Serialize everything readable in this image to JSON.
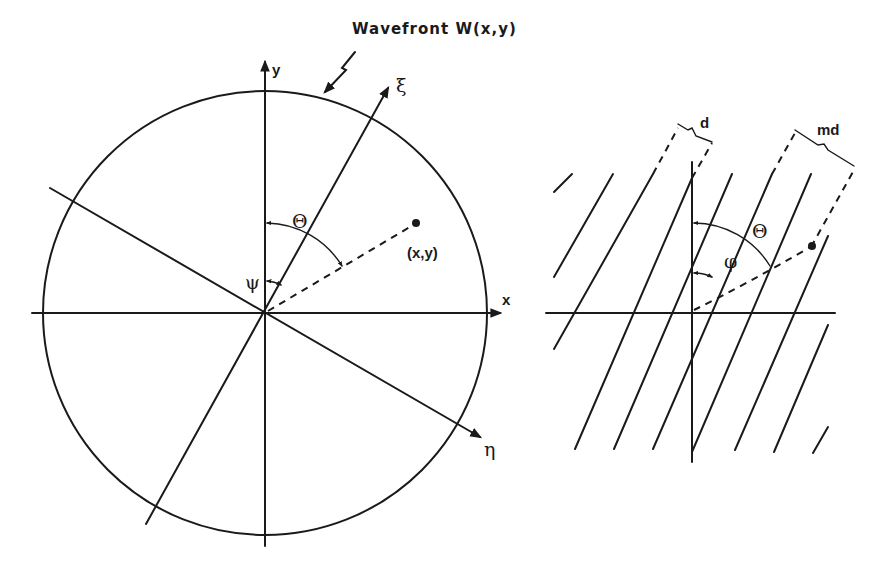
{
  "title": "Wavefront W(x,y)",
  "left_panel": {
    "axis_x_label": "x",
    "axis_y_label": "y",
    "axis_xi_label": "ξ",
    "axis_eta_label": "η",
    "point_label": "(x,y)",
    "angle_theta_label": "Θ",
    "angle_psi_label": "ψ"
  },
  "right_panel": {
    "spacing_label": "d",
    "multi_spacing_label": "md",
    "angle_theta_label": "Θ",
    "angle_phi_label": "φ"
  }
}
